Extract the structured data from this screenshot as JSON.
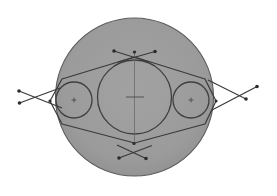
{
  "document": {
    "title": "Circular Flange Technical Drawing",
    "type": "cad-geometry-sketch",
    "canvas": {
      "width": 277,
      "height": 196
    }
  },
  "colors": {
    "background": "#ffffff",
    "disc_fill": "#9a9a9a",
    "disc_stroke": "#5c5c5c",
    "line_stroke": "#3a3a3a",
    "circle_stroke": "#3f3f3f",
    "centerline_stroke": "#6a6a6a",
    "node_fill": "#2b2b2b"
  },
  "strokes": {
    "disc_width": 1.1,
    "circle_width": 1.3,
    "construction_width": 1.2,
    "centerline_width": 0.8,
    "node_radius": 1.8
  },
  "shapes": {
    "outer_disc": {
      "name": "outer-disc",
      "cx": 134.5,
      "cy": 97.0,
      "r": 79.0
    },
    "center_bore": {
      "name": "center-bore-circle",
      "cx": 134.5,
      "cy": 97.0,
      "r": 37.0
    },
    "left_hole": {
      "name": "left-hole-circle",
      "cx": 74.0,
      "cy": 100.0,
      "r": 18.0
    },
    "right_hole": {
      "name": "right-hole-circle",
      "cx": 191.0,
      "cy": 100.0,
      "r": 18.0
    }
  },
  "hex_outline": {
    "name": "hexagonal-construction-outline",
    "points": "134.5,57.0 205.0,79.0 216.0,101.0 205.0,124.0 134.5,143.0 62.0,124.0 50.0,101.0 62.0,79.0"
  },
  "centerlines": {
    "vertical": {
      "x": 134.5,
      "y1": 52.0,
      "y2": 145.0
    },
    "horizontal": {
      "y": 97.0,
      "x1": 126.0,
      "x2": 144.0
    }
  },
  "center_marks": [
    {
      "name": "center-mark-bore",
      "cx": 134.5,
      "cy": 97.0,
      "size": 4.5
    },
    {
      "name": "center-mark-left-hole",
      "cx": 74.0,
      "cy": 100.0,
      "size": 2.4
    },
    {
      "name": "center-mark-right-hole",
      "cx": 191.0,
      "cy": 100.0,
      "size": 2.4
    }
  ],
  "construction_crosses": [
    {
      "name": "cross-top",
      "lines": [
        {
          "x1": 114.0,
          "y1": 51.0,
          "x2": 149.0,
          "y2": 62.0
        },
        {
          "x1": 155.0,
          "y1": 51.5,
          "x2": 118.0,
          "y2": 62.0
        }
      ],
      "nodes": [
        {
          "x": 114.0,
          "y": 51.0
        },
        {
          "x": 155.0,
          "y": 51.5
        },
        {
          "x": 134.5,
          "y": 52.0
        }
      ]
    },
    {
      "name": "cross-bottom",
      "lines": [
        {
          "x1": 119.0,
          "y1": 158.0,
          "x2": 152.0,
          "y2": 145.5
        },
        {
          "x1": 146.0,
          "y1": 158.5,
          "x2": 117.0,
          "y2": 145.0
        }
      ],
      "nodes": [
        {
          "x": 119.0,
          "y": 158.0
        },
        {
          "x": 146.0,
          "y": 158.5
        },
        {
          "x": 134.0,
          "y": 143.5
        }
      ]
    },
    {
      "name": "cross-left",
      "lines": [
        {
          "x1": 19.0,
          "y1": 91.0,
          "x2": 62.0,
          "y2": 108.0
        },
        {
          "x1": 19.5,
          "y1": 103.0,
          "x2": 60.0,
          "y2": 88.0
        }
      ],
      "nodes": [
        {
          "x": 19.0,
          "y": 91.0
        },
        {
          "x": 19.5,
          "y": 103.0
        },
        {
          "x": 50.0,
          "y": 101.0
        }
      ]
    },
    {
      "name": "cross-right",
      "lines": [
        {
          "x1": 257.0,
          "y1": 86.5,
          "x2": 212.0,
          "y2": 110.0
        },
        {
          "x1": 246.0,
          "y1": 99.0,
          "x2": 208.0,
          "y2": 80.0
        }
      ],
      "nodes": [
        {
          "x": 257.0,
          "y": 86.5
        },
        {
          "x": 246.0,
          "y": 99.0
        },
        {
          "x": 216.0,
          "y": 101.0
        }
      ]
    }
  ]
}
